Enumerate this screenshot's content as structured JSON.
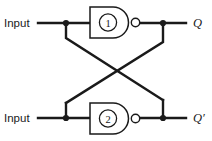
{
  "diagram": {
    "type": "logic-circuit-schematic",
    "line_color": "#1a1a1a",
    "background_color": "#ffffff",
    "inputs": [
      {
        "id": "input-top",
        "label": "Input"
      },
      {
        "id": "input-bottom",
        "label": "Input"
      }
    ],
    "gates": [
      {
        "id": "gate-1",
        "number": "1",
        "kind": "NAND",
        "row": "top"
      },
      {
        "id": "gate-2",
        "number": "2",
        "kind": "NAND",
        "row": "bottom"
      }
    ],
    "outputs": [
      {
        "id": "output-q",
        "label": "Q"
      },
      {
        "id": "output-qbar",
        "label": "Q′"
      }
    ]
  }
}
